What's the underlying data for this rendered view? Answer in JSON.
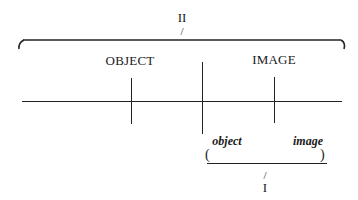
{
  "diagram": {
    "outer_group": {
      "label": "II",
      "pointer": "/",
      "bracket_open": "(",
      "bracket_close": ")"
    },
    "upper_labels": {
      "left": "OBJECT",
      "right": "IMAGE"
    },
    "axis": {
      "description": "horizontal line with three vertical ticks",
      "ticks": [
        "object-tick",
        "center-divider",
        "image-tick"
      ]
    },
    "inner_group": {
      "left_label": "object",
      "right_label": "image",
      "bracket_open": "(",
      "bracket_close": ")",
      "pointer": "/",
      "label": "I"
    },
    "colors": {
      "ink": "#222222",
      "background": "#ffffff"
    }
  }
}
